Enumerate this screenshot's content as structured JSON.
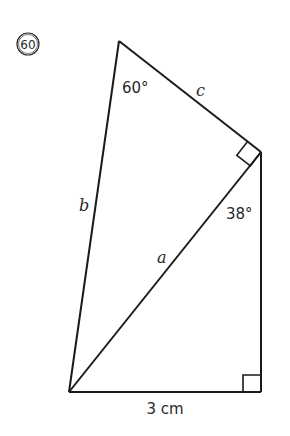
{
  "problem": {
    "number": "60",
    "number_display": "⑥⓪"
  },
  "figure": {
    "type": "two right triangles sharing hypotenuse a",
    "colors": {
      "stroke": "#1a1a1a",
      "text": "#2a2a2a",
      "background": "#ffffff"
    },
    "vertices": {
      "top": [
        119,
        41
      ],
      "right_top": [
        261,
        152
      ],
      "bottom_left": [
        69,
        392
      ],
      "bottom_right": [
        261,
        392
      ]
    },
    "labels": {
      "angle_top": "60°",
      "angle_right": "38°",
      "side_c": "c",
      "side_b": "b",
      "side_a": "a",
      "base": "3 cm"
    },
    "right_angle_marks": [
      "right_top",
      "bottom_right"
    ]
  }
}
